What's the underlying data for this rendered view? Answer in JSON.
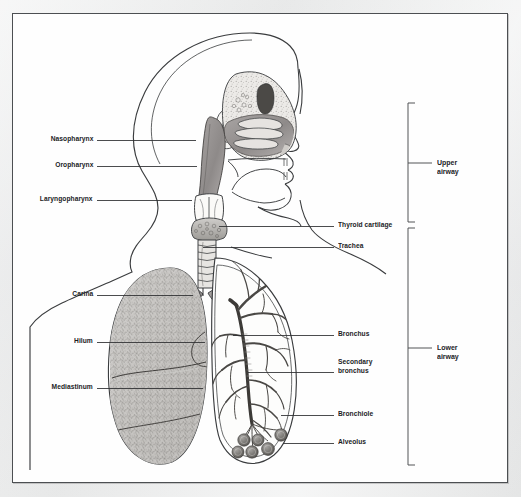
{
  "figure": {
    "caption_faint": "",
    "frame_color": "#4c4f52",
    "page_background": "#e9e9ea",
    "art_background": "#fefefe",
    "ink_color": "#1b1c1e",
    "leader_color": "#2b2d2f"
  },
  "labels_left": [
    {
      "id": "nasopharynx",
      "text": "Nasopharynx",
      "text_x": 93,
      "text_y": 140,
      "leader_x1": 97,
      "leader_x2": 196,
      "leader_y": 140
    },
    {
      "id": "oropharynx",
      "text": "Oropharynx",
      "text_x": 93,
      "text_y": 166,
      "leader_x1": 97,
      "leader_x2": 197,
      "leader_y": 166
    },
    {
      "id": "laryngopharynx",
      "text": "Laryngopharynx",
      "text_x": 93,
      "text_y": 200,
      "leader_x1": 97,
      "leader_x2": 192,
      "leader_y": 200
    },
    {
      "id": "carina",
      "text": "Carina",
      "text_x": 93,
      "text_y": 295,
      "leader_x1": 97,
      "leader_x2": 193,
      "leader_y": 295
    },
    {
      "id": "hilum",
      "text": "Hilum",
      "text_x": 93,
      "text_y": 342,
      "leader_x1": 97,
      "leader_x2": 205,
      "leader_y": 342
    },
    {
      "id": "mediastinum",
      "text": "Mediastinum",
      "text_x": 93,
      "text_y": 388,
      "leader_x1": 97,
      "leader_x2": 203,
      "leader_y": 388
    }
  ],
  "labels_right": [
    {
      "id": "thyroid-cartilage",
      "text": "Thyroid cartilage",
      "text_x": 338,
      "text_y": 226,
      "leader_x1": 219,
      "leader_x2": 334,
      "leader_y": 226
    },
    {
      "id": "trachea",
      "text": "Trachea",
      "text_x": 338,
      "text_y": 247,
      "leader_x1": 203,
      "leader_x2": 334,
      "leader_y": 247
    },
    {
      "id": "bronchus",
      "text": "Bronchus",
      "text_x": 338,
      "text_y": 335,
      "leader_x1": 233,
      "leader_x2": 334,
      "leader_y": 335
    },
    {
      "id": "secondary-bronchus",
      "text": "Secondary\nbronchus",
      "text_x": 338,
      "text_y": 368,
      "leader_x1": 248,
      "leader_x2": 334,
      "leader_y": 372
    },
    {
      "id": "bronchiole",
      "text": "Bronchiole",
      "text_x": 338,
      "text_y": 415,
      "leader_x1": 281,
      "leader_x2": 334,
      "leader_y": 415
    },
    {
      "id": "alveolus",
      "text": "Alveolus",
      "text_x": 338,
      "text_y": 443,
      "leader_x1": 283,
      "leader_x2": 334,
      "leader_y": 443
    }
  ],
  "brackets": [
    {
      "id": "upper-airway",
      "text": "Upper\nairway",
      "x": 408,
      "y_top": 103,
      "y_bottom": 222,
      "tick_y": 163,
      "tick_x2": 432,
      "text_x": 437,
      "text_y": 158
    },
    {
      "id": "lower-airway",
      "text": "Lower\nairway",
      "x": 408,
      "y_top": 228,
      "y_bottom": 465,
      "tick_y": 348,
      "tick_x2": 432,
      "text_x": 437,
      "text_y": 343
    }
  ],
  "anatomy_parts": [
    "skull-outline",
    "nasal-cavity",
    "turbinates",
    "sphenoid-sinus",
    "ear",
    "tongue",
    "hard-palate",
    "soft-palate",
    "jaw",
    "epiglottis",
    "larynx",
    "thyroid-gland",
    "trachea-rings",
    "neck-shoulders",
    "left-lung-parenchyma",
    "lobar-fissures",
    "right-lung-outline",
    "bronchial-tree",
    "alveolar-sacs",
    "carina",
    "hilum"
  ]
}
